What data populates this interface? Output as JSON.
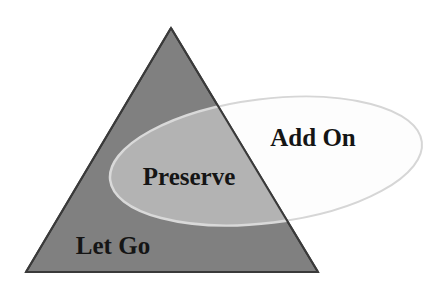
{
  "diagram": {
    "type": "venn-overlap",
    "background_color": "#ffffff",
    "shapes": {
      "triangle": {
        "name": "triangle",
        "fill_color": "#808080",
        "stroke_color": "#3a3a3a",
        "stroke_width": 2,
        "apex": {
          "x": 171,
          "y": 28
        },
        "bottom_left": {
          "x": 26,
          "y": 272
        },
        "bottom_right": {
          "x": 318,
          "y": 272
        }
      },
      "ellipse": {
        "name": "ellipse",
        "fill_color": "#fdfdfd",
        "stroke_color": "#d6d6d6",
        "stroke_width": 2,
        "center": {
          "x": 266,
          "y": 161
        },
        "radius_x": 157,
        "radius_y": 62,
        "rotation_deg": -7
      },
      "intersection": {
        "name": "intersection-region",
        "fill_color": "#b3b3b3",
        "stroke_color": "#d9d9d9"
      }
    },
    "labels": [
      {
        "id": "add-on",
        "text": "Add On",
        "x": 313,
        "y": 146,
        "region": "ellipse-only",
        "color": "#151515",
        "font_size": 25,
        "bold": true
      },
      {
        "id": "preserve",
        "text": "Preserve",
        "x": 189,
        "y": 185,
        "region": "intersection",
        "color": "#151515",
        "font_size": 25,
        "bold": true
      },
      {
        "id": "let-go",
        "text": "Let Go",
        "x": 113,
        "y": 254,
        "region": "triangle-only",
        "color": "#151515",
        "font_size": 25,
        "bold": true
      }
    ]
  }
}
